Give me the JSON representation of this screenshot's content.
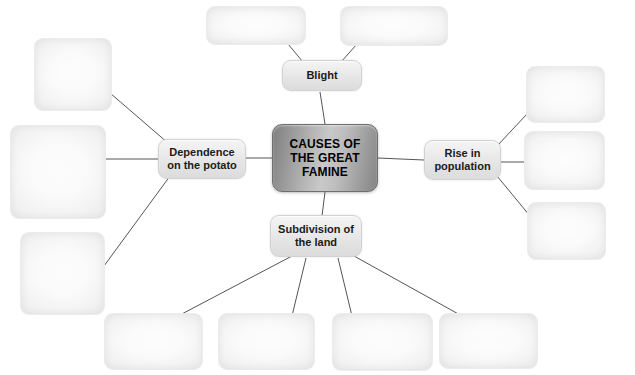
{
  "diagram": {
    "type": "mind-map",
    "title": "CAUSES OF THE GREAT FAMINE",
    "background_color": "#ffffff",
    "hub_color": "#b3b3b3",
    "node_color": "#ededed",
    "blank_color": "#f5f5f5",
    "connector_color": "#555555"
  },
  "hub": {
    "label": "CAUSES OF\nTHE GREAT\nFAMINE"
  },
  "branches": {
    "blight": {
      "label": "Blight"
    },
    "dependence": {
      "label": "Dependence\non the potato"
    },
    "population": {
      "label": "Rise in\npopulation"
    },
    "subdivision": {
      "label": "Subdivision of\nthe land"
    }
  },
  "blanks": {
    "top": [
      {
        "label": ""
      },
      {
        "label": ""
      }
    ],
    "left": [
      {
        "label": ""
      },
      {
        "label": ""
      },
      {
        "label": ""
      }
    ],
    "right": [
      {
        "label": ""
      },
      {
        "label": ""
      },
      {
        "label": ""
      }
    ],
    "bottom": [
      {
        "label": ""
      },
      {
        "label": ""
      },
      {
        "label": ""
      },
      {
        "label": ""
      }
    ]
  }
}
